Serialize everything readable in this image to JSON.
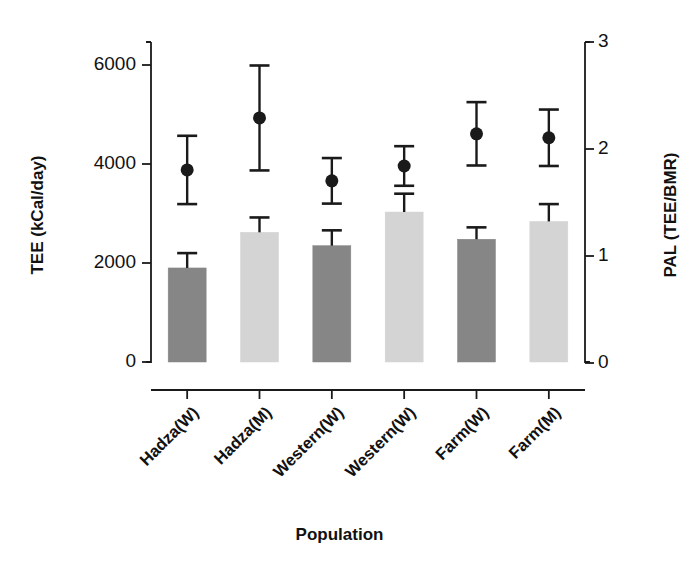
{
  "chart_data": {
    "type": "bar",
    "title": "",
    "subtitle": "",
    "xlabel": "Population",
    "ylabel": "TEE (kCal/day)",
    "ylabel_right": "PAL (TEE/BMR)",
    "categories": [
      "Hadza(W)",
      "Hadza(M)",
      "Western(W)",
      "Western(W)",
      "Farm(W)",
      "Farm(M)"
    ],
    "ylim": [
      0,
      6600
    ],
    "yticks": [
      0,
      2000,
      4000,
      6000
    ],
    "ytick_labels": [
      "0",
      "2000",
      "4000",
      "6000"
    ],
    "ylim_right": [
      0,
      3.1
    ],
    "yticks_right": [
      0,
      1,
      2,
      3
    ],
    "ytick_labels_right": [
      "0",
      "1",
      "2",
      "3"
    ],
    "grid": false,
    "legend": "none",
    "series": [
      {
        "name": "TEE (bars)",
        "kind": "bar",
        "unit": "kCal/day",
        "values": [
          1900,
          2620,
          2350,
          3030,
          2480,
          2840
        ],
        "errors": [
          300,
          300,
          310,
          370,
          240,
          350
        ],
        "colors": [
          "#868686",
          "#d4d4d4",
          "#868686",
          "#d4d4d4",
          "#868686",
          "#d4d4d4"
        ]
      },
      {
        "name": "PAL (points)",
        "kind": "point",
        "unit": "TEE/BMR",
        "values": [
          3880,
          4930,
          3660,
          3960,
          4610,
          4530
        ],
        "errors_upper": [
          690,
          1060,
          460,
          400,
          640,
          570
        ],
        "errors_lower": [
          690,
          1060,
          460,
          400,
          640,
          570
        ],
        "pal_values": [
          1.79,
          2.19,
          1.7,
          1.82,
          2.06,
          2.03
        ],
        "color": "#1a1a1a"
      }
    ]
  },
  "axes": {
    "left_title": "TEE (kCal/day)",
    "right_title": "PAL (TEE/BMR)",
    "bottom_title": "Population"
  }
}
